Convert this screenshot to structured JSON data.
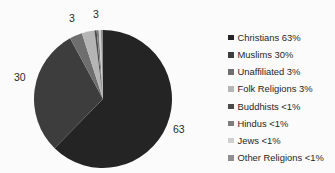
{
  "chart_data": {
    "type": "pie",
    "title": "",
    "legend_position": "right",
    "categories": [
      "Christians",
      "Muslims",
      "Unaffiliated",
      "Folk Religions",
      "Buddhists",
      "Hindus",
      "Jews",
      "Other Religions"
    ],
    "values": [
      63,
      30,
      3,
      3,
      0.5,
      0.5,
      0.5,
      0.5
    ],
    "value_labels": [
      "63%",
      "30%",
      "3%",
      "3%",
      "<1%",
      "<1%",
      "<1%",
      "<1%"
    ],
    "slice_labels": [
      "63",
      "30",
      "3",
      "3"
    ],
    "colors": [
      "#242424",
      "#3d3d3d",
      "#6e6e6e",
      "#b5b5b5",
      "#4a4a4a",
      "#7d7d7d",
      "#cfcfcf",
      "#8f8f8f"
    ],
    "start_angle": 0,
    "direction": "clockwise",
    "legend": [
      {
        "label": "Christians 63%",
        "color": "#242424"
      },
      {
        "label": "Muslims 30%",
        "color": "#3d3d3d"
      },
      {
        "label": "Unaffiliated 3%",
        "color": "#6e6e6e"
      },
      {
        "label": "Folk Religions 3%",
        "color": "#b5b5b5"
      },
      {
        "label": "Buddhists <1%",
        "color": "#4a4a4a"
      },
      {
        "label": "Hindus <1%",
        "color": "#7d7d7d"
      },
      {
        "label": "Jews <1%",
        "color": "#cfcfcf"
      },
      {
        "label": "Other Religions <1%",
        "color": "#8f8f8f"
      }
    ],
    "annotations": [
      {
        "text": "3",
        "x": 69,
        "y": 13
      },
      {
        "text": "3",
        "x": 93,
        "y": 9
      },
      {
        "text": "30",
        "x": 14,
        "y": 72
      },
      {
        "text": "63",
        "x": 173,
        "y": 124
      }
    ]
  }
}
